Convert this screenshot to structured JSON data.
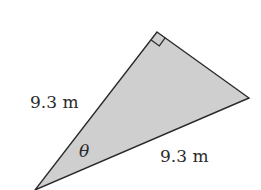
{
  "figure": {
    "type": "right-triangle",
    "fill_color": "#cfcfcf",
    "stroke_color": "#2a2a2a",
    "vertices": {
      "right_angle": [
        157,
        32
      ],
      "right": [
        249,
        98
      ],
      "bottom_left": [
        35,
        190
      ]
    },
    "labels": {
      "left_side": "9.3 m",
      "bottom_side": "9.3 m",
      "angle": "θ"
    }
  }
}
